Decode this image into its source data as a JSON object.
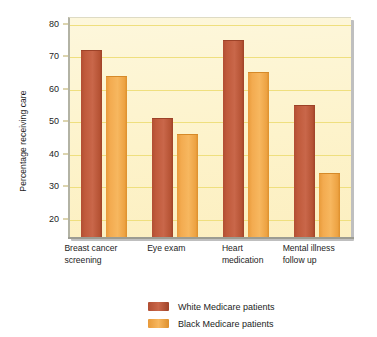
{
  "chart_data": {
    "type": "bar",
    "title": "",
    "subtitle": "",
    "xlabel": "",
    "ylabel": "Percentage receiving care",
    "ylim": [
      14,
      82
    ],
    "yticks": [
      20,
      30,
      40,
      50,
      60,
      70,
      80
    ],
    "ytick_labels": [
      "20",
      "30",
      "40",
      "50",
      "60",
      "70",
      "80"
    ],
    "grid": true,
    "grid_axis": "y",
    "legend_position": "bottom-center",
    "categories": [
      "Breast cancer screening",
      "Eye exam",
      "Heart medication",
      "Mental illness follow up"
    ],
    "category_lines": [
      [
        "Breast cancer",
        "screening"
      ],
      [
        "Eye exam",
        ""
      ],
      [
        "Heart",
        "medication"
      ],
      [
        "Mental illness",
        "follow up"
      ]
    ],
    "series": [
      {
        "name": "White Medicare patients",
        "color": "#c45a3c",
        "values": [
          72,
          51,
          75,
          55
        ]
      },
      {
        "name": "Black Medicare patients",
        "color": "#f5a94a",
        "values": [
          64,
          46,
          65,
          34
        ]
      }
    ],
    "plot_background": "#fdf3cb",
    "gridline_color": "#efdf7e",
    "axis_color": "#9c9c92"
  },
  "legend": {
    "items": [
      {
        "label": "White Medicare patients",
        "color": "#c45a3c"
      },
      {
        "label": "Black Medicare patients",
        "color": "#f5a94a"
      }
    ]
  }
}
